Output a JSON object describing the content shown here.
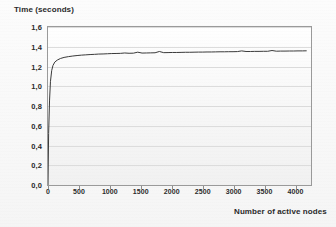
{
  "chart_data": {
    "type": "line",
    "title": "",
    "xlabel": "Number of active nodes",
    "ylabel": "Time (seconds)",
    "xlim": [
      0,
      4250
    ],
    "ylim": [
      0.0,
      1.6
    ],
    "grid": true,
    "legend": "none",
    "decimal_separator": ",",
    "xticks": [
      {
        "value": 0,
        "label": "0"
      },
      {
        "value": 500,
        "label": "500"
      },
      {
        "value": 1000,
        "label": "1000"
      },
      {
        "value": 1500,
        "label": "1500"
      },
      {
        "value": 2000,
        "label": "2000"
      },
      {
        "value": 2500,
        "label": "2500"
      },
      {
        "value": 3000,
        "label": "3000"
      },
      {
        "value": 3500,
        "label": "3500"
      },
      {
        "value": 4000,
        "label": "4000"
      }
    ],
    "yticks": [
      {
        "value": 0.0,
        "label": "0,0"
      },
      {
        "value": 0.2,
        "label": "0,2"
      },
      {
        "value": 0.4,
        "label": "0,4"
      },
      {
        "value": 0.6,
        "label": "0,6"
      },
      {
        "value": 0.8,
        "label": "0,8"
      },
      {
        "value": 1.0,
        "label": "1,0"
      },
      {
        "value": 1.2,
        "label": "1,2"
      },
      {
        "value": 1.4,
        "label": "1,4"
      },
      {
        "value": 1.6,
        "label": "1,6"
      }
    ],
    "series": [
      {
        "name": "response time",
        "color": "#3a3a3a",
        "x": [
          0,
          10,
          25,
          40,
          60,
          80,
          110,
          150,
          200,
          260,
          330,
          400,
          470,
          540,
          610,
          680,
          750,
          820,
          890,
          960,
          1030,
          1100,
          1170,
          1240,
          1310,
          1380,
          1450,
          1520,
          1590,
          1660,
          1730,
          1800,
          1870,
          1940,
          2010,
          2080,
          2150,
          2220,
          2290,
          2360,
          2430,
          2500,
          2570,
          2640,
          2710,
          2780,
          2850,
          2920,
          2990,
          3060,
          3130,
          3200,
          3270,
          3340,
          3410,
          3480,
          3550,
          3620,
          3690,
          3760,
          3830,
          3900,
          3970,
          4040,
          4110,
          4180
        ],
        "y": [
          0.0,
          0.52,
          0.86,
          1.05,
          1.16,
          1.21,
          1.245,
          1.265,
          1.281,
          1.292,
          1.3,
          1.306,
          1.311,
          1.315,
          1.318,
          1.321,
          1.323,
          1.326,
          1.327,
          1.329,
          1.331,
          1.332,
          1.333,
          1.337,
          1.334,
          1.335,
          1.345,
          1.336,
          1.337,
          1.338,
          1.339,
          1.352,
          1.34,
          1.341,
          1.342,
          1.342,
          1.343,
          1.344,
          1.344,
          1.345,
          1.346,
          1.346,
          1.347,
          1.347,
          1.348,
          1.349,
          1.349,
          1.35,
          1.35,
          1.351,
          1.358,
          1.352,
          1.352,
          1.353,
          1.353,
          1.354,
          1.354,
          1.362,
          1.355,
          1.356,
          1.356,
          1.357,
          1.357,
          1.358,
          1.358,
          1.359
        ]
      }
    ]
  }
}
